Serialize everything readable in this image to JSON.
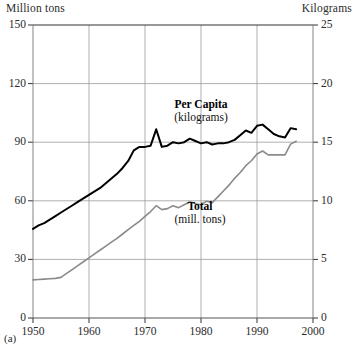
{
  "figure": {
    "panel_caption": "(a)",
    "left_axis_unit": "Million tons",
    "right_axis_unit": "Kilograms"
  },
  "chart_data": {
    "type": "line",
    "title": "",
    "subtitle": "",
    "xlabel": "",
    "ylabel": "Million tons",
    "y2label": "Kilograms",
    "xlim": [
      1950,
      2000
    ],
    "ylim": [
      0,
      150
    ],
    "y2lim": [
      0,
      25
    ],
    "xticks": [
      1950,
      1960,
      1970,
      1980,
      1990,
      2000
    ],
    "xtick_labels": [
      "1950",
      "1960",
      "1970",
      "1980",
      "1990",
      "2000"
    ],
    "yticks": [
      0,
      30,
      60,
      90,
      120,
      150
    ],
    "ytick_labels": [
      "0",
      "30",
      "60",
      "90",
      "120",
      "150"
    ],
    "y2ticks": [
      0,
      5,
      10,
      15,
      20,
      25
    ],
    "y2tick_labels": [
      "0",
      "5",
      "10",
      "15",
      "20",
      "25"
    ],
    "grid": true,
    "legend_position": "inline-annotations",
    "series": [
      {
        "name": "Per Capita",
        "unit_label": "(kilograms)",
        "axis": "right",
        "color": "#000000",
        "line_width": 2.0,
        "annotation": "Per Capita\n(kilograms)",
        "x": [
          1950,
          1951,
          1952,
          1953,
          1954,
          1955,
          1956,
          1957,
          1958,
          1959,
          1960,
          1961,
          1962,
          1963,
          1964,
          1965,
          1966,
          1967,
          1968,
          1969,
          1970,
          1971,
          1972,
          1973,
          1974,
          1975,
          1976,
          1977,
          1978,
          1979,
          1980,
          1981,
          1982,
          1983,
          1984,
          1985,
          1986,
          1987,
          1988,
          1989,
          1990,
          1991,
          1992,
          1993,
          1994,
          1995,
          1996,
          1997
        ],
        "values": [
          7.6,
          7.9,
          8.1,
          8.4,
          8.7,
          9.0,
          9.3,
          9.6,
          9.9,
          10.2,
          10.5,
          10.8,
          11.1,
          11.5,
          11.9,
          12.3,
          12.8,
          13.4,
          14.3,
          14.6,
          14.6,
          14.7,
          16.1,
          14.6,
          14.7,
          15.0,
          14.9,
          15.0,
          15.3,
          15.1,
          14.9,
          15.0,
          14.8,
          14.9,
          14.9,
          15.0,
          15.2,
          15.6,
          16.0,
          15.8,
          16.4,
          16.5,
          16.1,
          15.7,
          15.5,
          15.4,
          16.2,
          16.1
        ],
        "units": "kilograms per capita"
      },
      {
        "name": "Total",
        "unit_label": "(mill. tons)",
        "axis": "left",
        "color": "#8a8a8a",
        "line_width": 1.6,
        "annotation": "Total\n(mill. tons)",
        "x": [
          1950,
          1951,
          1952,
          1953,
          1954,
          1955,
          1956,
          1957,
          1958,
          1959,
          1960,
          1961,
          1962,
          1963,
          1964,
          1965,
          1966,
          1967,
          1968,
          1969,
          1970,
          1971,
          1972,
          1973,
          1974,
          1975,
          1976,
          1977,
          1978,
          1979,
          1980,
          1981,
          1982,
          1983,
          1984,
          1985,
          1986,
          1987,
          1988,
          1989,
          1990,
          1991,
          1992,
          1993,
          1994,
          1995,
          1996,
          1997
        ],
        "values": [
          19.5,
          19.7,
          19.9,
          20.1,
          20.3,
          20.8,
          22.8,
          24.8,
          26.8,
          28.8,
          30.8,
          32.8,
          34.8,
          36.8,
          38.8,
          40.8,
          43.0,
          45.2,
          47.4,
          49.5,
          52.0,
          54.5,
          57.5,
          55.5,
          56.0,
          57.5,
          56.5,
          58.0,
          59.5,
          58.5,
          58.0,
          59.8,
          59.0,
          62.0,
          65.0,
          68.0,
          71.5,
          74.5,
          78.0,
          80.5,
          84.0,
          85.5,
          83.5,
          83.5,
          83.5,
          83.5,
          89.0,
          90.5
        ],
        "units": "million tons"
      }
    ]
  }
}
